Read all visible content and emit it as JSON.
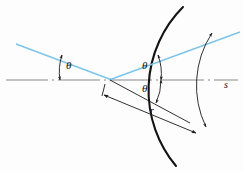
{
  "figure": {
    "name": "spherical-mirror-reflection-diagram",
    "background_color": "#fdfdfd",
    "width": 243,
    "height": 173
  },
  "colors": {
    "ray": "#7fc4e8",
    "ink": "#1a1a1a",
    "axis": "#8a8a8a",
    "mirror": "#141414"
  },
  "labels": {
    "theta_incident": "θ",
    "theta_upper": "θ",
    "theta_lower": "θ",
    "radius": "r",
    "arc_length": "s"
  },
  "geometry": {
    "vertex": {
      "x": 110,
      "y": 80
    },
    "axis": {
      "x1": 6,
      "y1": 80,
      "x2": 238,
      "y2": 80
    },
    "incident_ray": {
      "x1": 16,
      "y1": 44,
      "x2": 110,
      "y2": 80
    },
    "reflected_ray": {
      "x1": 110,
      "y1": 80,
      "x2": 240,
      "y2": 32
    },
    "radius_line": {
      "x1": 106,
      "y1": 92,
      "x2": 196,
      "y2": 131
    },
    "mirror_arc": {
      "start": {
        "x": 183,
        "y": 7
      },
      "end": {
        "x": 176,
        "y": 166
      },
      "radius": 118,
      "sweep": 0
    },
    "arc_s": {
      "start": {
        "x": 211,
        "y": 33
      },
      "end": {
        "x": 205,
        "y": 126
      },
      "radius": 96
    }
  },
  "elements": {
    "incident_ray_name": "incident-light-ray",
    "reflected_ray_name": "reflected-light-ray",
    "axis_name": "optical-axis-centerline",
    "mirror_name": "concave-mirror-surface",
    "radius_name": "radius-dimension-line",
    "arc_name": "arc-length-dimension"
  }
}
